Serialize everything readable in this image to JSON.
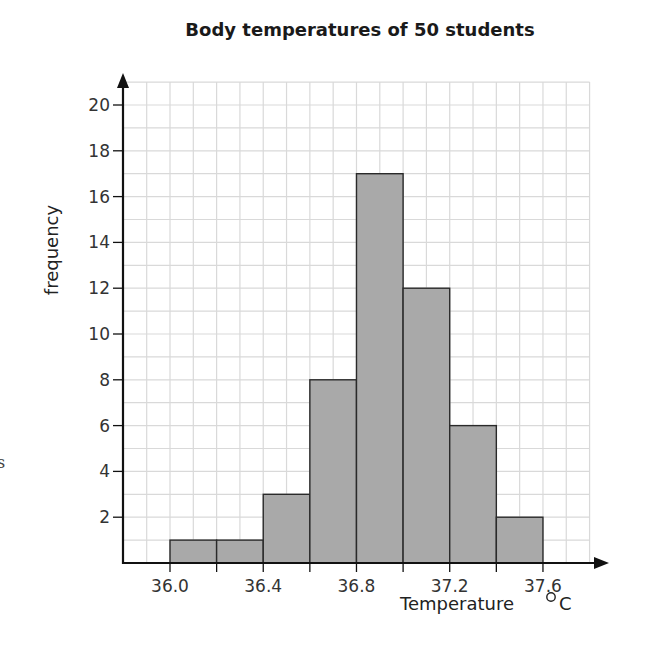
{
  "chart_data": {
    "type": "bar",
    "subtype": "histogram",
    "title": "Body temperatures of 50 students",
    "xlabel": "Temperature °C",
    "xlabel_parts": {
      "text": "Temperature",
      "unit": "°C"
    },
    "ylabel": "frequency",
    "bins": [
      {
        "from": 36.0,
        "to": 36.2,
        "frequency": 1
      },
      {
        "from": 36.2,
        "to": 36.4,
        "frequency": 1
      },
      {
        "from": 36.4,
        "to": 36.6,
        "frequency": 3
      },
      {
        "from": 36.6,
        "to": 36.8,
        "frequency": 8
      },
      {
        "from": 36.8,
        "to": 37.0,
        "frequency": 17
      },
      {
        "from": 37.0,
        "to": 37.2,
        "frequency": 12
      },
      {
        "from": 37.2,
        "to": 37.4,
        "frequency": 6
      },
      {
        "from": 37.4,
        "to": 37.6,
        "frequency": 2
      }
    ],
    "categories": [
      "36.0-36.2",
      "36.2-36.4",
      "36.4-36.6",
      "36.6-36.8",
      "36.8-37.0",
      "37.0-37.2",
      "37.2-37.4",
      "37.4-37.6"
    ],
    "values": [
      1,
      1,
      3,
      8,
      17,
      12,
      6,
      2
    ],
    "total": 50,
    "x_tick_labels": [
      "36.0",
      "36.4",
      "36.8",
      "37.2",
      "37.6"
    ],
    "x_tick_values": [
      36.0,
      36.2,
      36.4,
      36.6,
      36.8,
      37.0,
      37.2,
      37.4,
      37.6
    ],
    "y_tick_labels": [
      "2",
      "4",
      "6",
      "8",
      "10",
      "12",
      "14",
      "16",
      "18",
      "20"
    ],
    "y_tick_values": [
      2,
      4,
      6,
      8,
      10,
      12,
      14,
      16,
      18,
      20
    ],
    "xlim": [
      35.8,
      37.8
    ],
    "ylim": [
      0,
      21
    ],
    "grid": true,
    "grid_step": {
      "x": 0.1,
      "y": 1
    },
    "legend": null
  },
  "colors": {
    "bar_fill": "#a9a9a9",
    "bar_stroke": "#2a2a2a",
    "grid": "#d9d9d9",
    "axis": "#111111",
    "text": "#333333"
  },
  "margin_fragment": "s"
}
